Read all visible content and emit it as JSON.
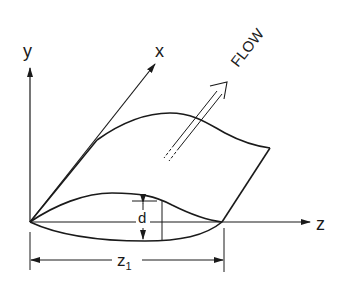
{
  "diagram": {
    "type": "wave-surface schematic",
    "axes": {
      "y_label": "y",
      "x_label": "x",
      "z_label": "z"
    },
    "annotations": {
      "flow_label": "FLOW",
      "depth_label": "d",
      "length_label": "z",
      "length_subscript": "1"
    },
    "colors": {
      "stroke": "#1a1a1a",
      "background": "#ffffff"
    }
  }
}
